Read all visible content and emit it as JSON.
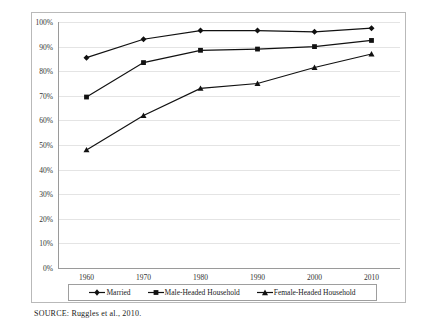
{
  "chart_data": {
    "type": "line",
    "title": "",
    "subtitle": "",
    "xlabel": "",
    "ylabel": "",
    "categories": [
      "1960",
      "1970",
      "1980",
      "1990",
      "2000",
      "2010"
    ],
    "x": [
      1960,
      1970,
      1980,
      1990,
      2000,
      2010
    ],
    "xlim": [
      1955,
      2015
    ],
    "ylim": [
      0,
      100
    ],
    "ytick_labels": [
      "0%",
      "10%",
      "20%",
      "30%",
      "40%",
      "50%",
      "60%",
      "70%",
      "80%",
      "90%",
      "100%"
    ],
    "ytick_values": [
      0,
      10,
      20,
      30,
      40,
      50,
      60,
      70,
      80,
      90,
      100
    ],
    "grid": true,
    "legend_position": "bottom",
    "series": [
      {
        "name": "Married",
        "marker": "diamond",
        "color": "#111111",
        "values": [
          85.5,
          93.0,
          96.5,
          96.5,
          96.0,
          97.5
        ]
      },
      {
        "name": "Male-Headed Household",
        "marker": "square",
        "color": "#111111",
        "values": [
          69.5,
          83.5,
          88.5,
          89.0,
          90.0,
          92.5
        ]
      },
      {
        "name": "Female-Headed Household",
        "marker": "triangle",
        "color": "#111111",
        "values": [
          48.0,
          62.0,
          73.0,
          75.0,
          81.5,
          87.0
        ]
      }
    ],
    "annotations": []
  },
  "source_note": "SOURCE:  Ruggles et al., 2010."
}
